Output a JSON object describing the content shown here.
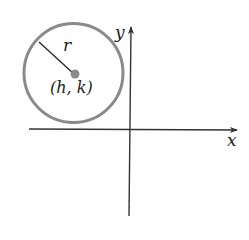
{
  "diagram": {
    "labels": {
      "radius": "r",
      "center": "(h, k)",
      "x_axis": "x",
      "y_axis": "y"
    },
    "colors": {
      "circle_stroke": "#8a8a8a",
      "center_dot": "#8a8a8a",
      "axes": "#333333",
      "radius_line": "#222222",
      "text": "#222222"
    }
  }
}
